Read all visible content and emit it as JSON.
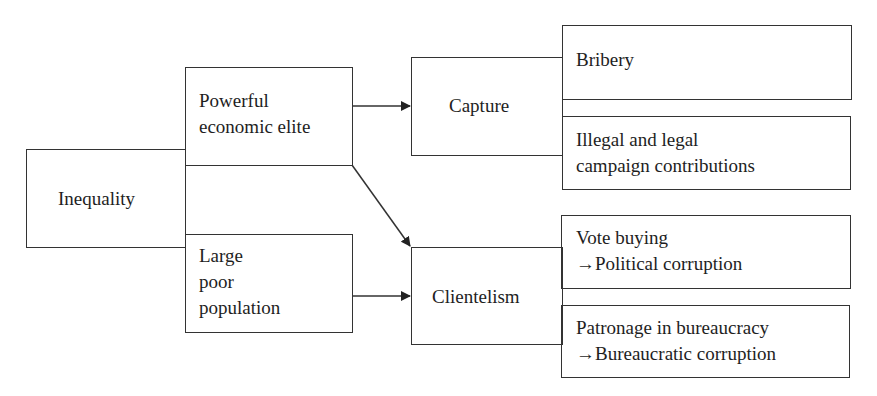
{
  "diagram": {
    "nodes": {
      "inequality": {
        "label": "Inequality"
      },
      "elite": {
        "label": "Powerful\neconomic elite"
      },
      "poor": {
        "label": "Large\npoor\npopulation"
      },
      "capture": {
        "label": "Capture"
      },
      "clientelism": {
        "label": "Clientelism"
      },
      "bribery": {
        "label": "Bribery"
      },
      "campaign": {
        "label": "Illegal and legal\ncampaign contributions"
      },
      "vote": {
        "label": "Vote buying\n→Political corruption"
      },
      "patronage": {
        "label": "Patronage in bureaucracy\n→Bureaucratic corruption"
      }
    },
    "edges": [
      {
        "from": "Powerful economic elite",
        "to": "Capture",
        "type": "arrow"
      },
      {
        "from": "Powerful economic elite",
        "to": "Clientelism",
        "type": "arrow"
      },
      {
        "from": "Large poor population",
        "to": "Clientelism",
        "type": "arrow"
      },
      {
        "from": "Inequality",
        "to": "Powerful economic elite",
        "type": "adjacent"
      },
      {
        "from": "Inequality",
        "to": "Large poor population",
        "type": "adjacent"
      },
      {
        "from": "Capture",
        "to": "Bribery",
        "type": "adjacent"
      },
      {
        "from": "Capture",
        "to": "Illegal and legal campaign contributions",
        "type": "adjacent"
      },
      {
        "from": "Clientelism",
        "to": "Vote buying",
        "type": "adjacent"
      },
      {
        "from": "Clientelism",
        "to": "Patronage in bureaucracy",
        "type": "adjacent"
      }
    ]
  }
}
